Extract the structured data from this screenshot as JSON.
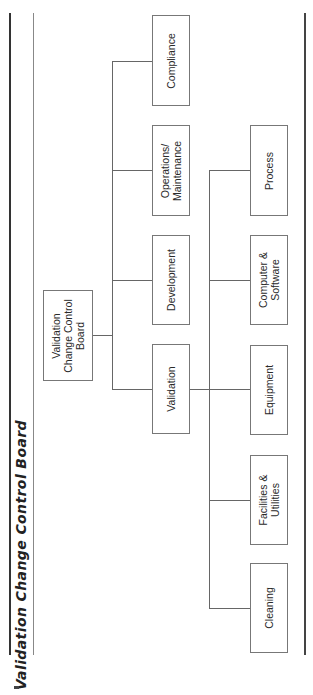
{
  "title": "Validation Change Control Board",
  "root": {
    "label": "Validation\nChange Control\nBoard"
  },
  "level1": [
    {
      "label": "Compliance"
    },
    {
      "label": "Operations/\nMaintenance"
    },
    {
      "label": "Development"
    },
    {
      "label": "Validation"
    }
  ],
  "level2_parent": "Validation",
  "level2": [
    {
      "label": "Process"
    },
    {
      "label": "Computer &\nSoftware"
    },
    {
      "label": "Equipment"
    },
    {
      "label": "Facilities &\nUtilities"
    },
    {
      "label": "Cleaning"
    }
  ],
  "colors": {
    "line": "#666666",
    "box_border": "#777777",
    "text": "#2a2a2a"
  }
}
